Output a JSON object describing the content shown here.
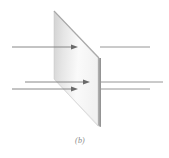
{
  "figure": {
    "caption": "(b)",
    "colors": {
      "background": "#ffffff",
      "plate_light": "#f7f7f7",
      "plate_shade": "#d4d4d4",
      "plate_edge": "#9c9c9c",
      "plate_outline": "#b0b0b0",
      "line": "#7a7a7a",
      "arrowhead": "#6a6a6a"
    },
    "plate": {
      "top_left": [
        54,
        11
      ],
      "top_right": [
        98,
        58
      ],
      "bottom_right": [
        98,
        126
      ],
      "bottom_left": [
        54,
        79
      ],
      "edge_thickness": 3
    },
    "field_lines": [
      {
        "y": 47,
        "x_start": 12,
        "x_end": 150,
        "arrow_tip_x": 77,
        "direction": "right"
      },
      {
        "y": 82,
        "x_start": 25,
        "x_end": 163,
        "arrow_tip_x": 89,
        "direction": "right"
      },
      {
        "y": 89,
        "x_start": 12,
        "x_end": 150,
        "arrow_tip_x": 77,
        "direction": "right"
      }
    ]
  }
}
